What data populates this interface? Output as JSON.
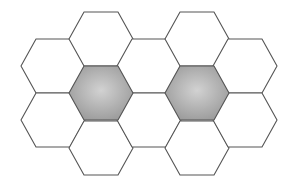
{
  "diagram": {
    "type": "hexagonal-grid",
    "hex_radius_x": 32,
    "hex_half_height": 27,
    "top_edge_half": 17,
    "column_spacing": 48,
    "colors": {
      "stroke": "#555555",
      "fill_plain": "#ffffff",
      "fill_shaded_center": "#cfcfcf",
      "fill_shaded_edge": "#9a9a9a"
    },
    "hexagons": [
      {
        "col": 0,
        "cx": 53,
        "cy": 66,
        "shaded": false
      },
      {
        "col": 0,
        "cx": 53,
        "cy": 120,
        "shaded": false
      },
      {
        "col": 1,
        "cx": 101,
        "cy": 39,
        "shaded": false
      },
      {
        "col": 1,
        "cx": 101,
        "cy": 93,
        "shaded": true
      },
      {
        "col": 1,
        "cx": 101,
        "cy": 148,
        "shaded": false
      },
      {
        "col": 2,
        "cx": 149,
        "cy": 66,
        "shaded": false
      },
      {
        "col": 2,
        "cx": 149,
        "cy": 120,
        "shaded": false
      },
      {
        "col": 3,
        "cx": 197,
        "cy": 39,
        "shaded": false
      },
      {
        "col": 3,
        "cx": 197,
        "cy": 93,
        "shaded": true
      },
      {
        "col": 3,
        "cx": 197,
        "cy": 148,
        "shaded": false
      },
      {
        "col": 4,
        "cx": 245,
        "cy": 66,
        "shaded": false
      },
      {
        "col": 4,
        "cx": 245,
        "cy": 120,
        "shaded": false
      }
    ]
  }
}
